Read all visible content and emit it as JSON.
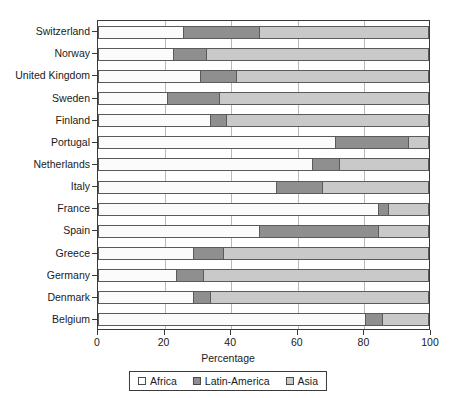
{
  "chart_data": {
    "type": "bar",
    "orientation": "horizontal",
    "stacked": true,
    "title": "",
    "xlabel": "Percentage",
    "ylabel": "",
    "xlim": [
      0,
      100
    ],
    "xticks": [
      0,
      20,
      40,
      60,
      80,
      100
    ],
    "grid": true,
    "legend_position": "bottom",
    "categories": [
      "Switzerland",
      "Norway",
      "United Kingdom",
      "Sweden",
      "Finland",
      "Portugal",
      "Netherlands",
      "Italy",
      "France",
      "Spain",
      "Greece",
      "Germany",
      "Denmark",
      "Belgium"
    ],
    "series": [
      {
        "name": "Africa",
        "color": "#ffffff",
        "values": [
          26,
          23,
          31,
          21,
          34,
          72,
          65,
          54,
          85,
          49,
          29,
          24,
          29,
          81
        ]
      },
      {
        "name": "Latin-America",
        "color": "#8f8f8f",
        "values": [
          23,
          10,
          11,
          16,
          5,
          22,
          8,
          14,
          3,
          36,
          9,
          8,
          5,
          5
        ]
      },
      {
        "name": "Asia",
        "color": "#c9c9c9",
        "values": [
          51,
          67,
          58,
          63,
          61,
          6,
          27,
          32,
          12,
          15,
          62,
          68,
          66,
          14
        ]
      }
    ]
  },
  "legend": {
    "items": [
      {
        "label": "Africa",
        "swatch": "africa"
      },
      {
        "label": "Latin-America",
        "swatch": "latin"
      },
      {
        "label": "Asia",
        "swatch": "asia"
      }
    ]
  },
  "axis": {
    "x_title": "Percentage",
    "tick_labels": [
      "0",
      "20",
      "40",
      "60",
      "80",
      "100"
    ]
  }
}
